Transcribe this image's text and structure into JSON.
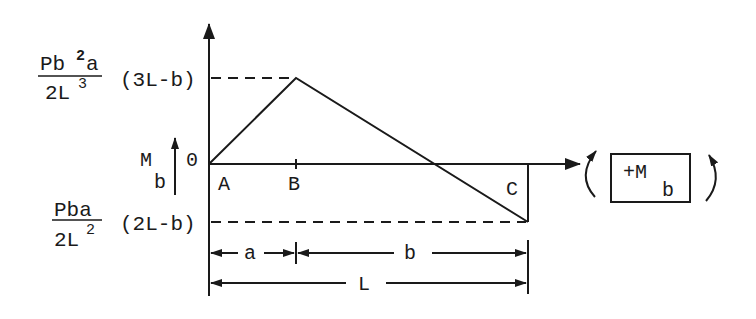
{
  "diagram": {
    "y_axis": {
      "label_main": "M",
      "label_sub": "b",
      "origin_label": "0"
    },
    "upper_value": {
      "numerator_P": "Pb",
      "numerator_exp": "2",
      "numerator_a": "a",
      "denominator_base": "2L",
      "denominator_exp": "3",
      "factor": "(3L-b)"
    },
    "lower_value": {
      "numerator": "Pba",
      "denominator_base": "2L",
      "denominator_exp": "2",
      "factor": "(2L-b)"
    },
    "points": [
      {
        "name": "A",
        "label": "A"
      },
      {
        "name": "B",
        "label": "B"
      },
      {
        "name": "C",
        "label": "C"
      }
    ],
    "dimensions": {
      "a": "a",
      "b": "b",
      "L": "L"
    },
    "sign_convention": {
      "label_main": "+M",
      "label_sub": "b"
    },
    "colors": {
      "ink": "#1a1a1a",
      "background": "#ffffff"
    }
  }
}
